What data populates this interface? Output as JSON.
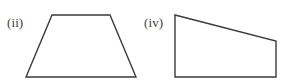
{
  "figure": {
    "background_color": "#ffffff",
    "stroke_color": "#3a3a3a",
    "label_color": "#3d3d3d",
    "width": 285,
    "height": 84,
    "shapes": [
      {
        "id": "shape-ii",
        "label": "(ii)",
        "name": "isosceles-trapezoid",
        "label_x": 7,
        "label_y": 16,
        "points": "52,15 110,15 136,77 26,77",
        "vertices": [
          {
            "name": "top-left",
            "x": 52,
            "y": 15
          },
          {
            "name": "top-right",
            "x": 110,
            "y": 15
          },
          {
            "name": "bottom-right",
            "x": 136,
            "y": 77
          },
          {
            "name": "bottom-left",
            "x": 26,
            "y": 77
          }
        ]
      },
      {
        "id": "shape-iv",
        "label": "(iv)",
        "name": "right-trapezoid",
        "label_x": 144,
        "label_y": 16,
        "points": "175,15 276,41 276,77 175,77",
        "vertices": [
          {
            "name": "top-left",
            "x": 175,
            "y": 15
          },
          {
            "name": "top-right",
            "x": 276,
            "y": 41
          },
          {
            "name": "bottom-right",
            "x": 276,
            "y": 77
          },
          {
            "name": "bottom-left",
            "x": 175,
            "y": 77
          }
        ]
      }
    ]
  }
}
